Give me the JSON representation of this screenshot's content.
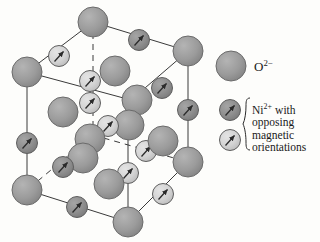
{
  "figure": {
    "background_color": "#fdfdfb",
    "line_color": "#3a3a3a"
  },
  "legend": {
    "oxygen": {
      "icon": "large-gray-sphere",
      "label_main": "O",
      "label_sup": "2−",
      "color": "#9b9b9b",
      "stroke": "#6b6b6b"
    },
    "nickel": {
      "icon_dark": "dark-gray-sphere-with-arrow",
      "icon_light": "light-gray-sphere-with-arrow",
      "color_dark": "#8e8e8e",
      "color_light": "#d3d3d3",
      "stroke": "#5f5f5f",
      "arrow_color": "#2b2b2b",
      "brace": "curly-brace",
      "label_line1_main": "Ni",
      "label_line1_sup": "2+",
      "label_line1_rest": " with",
      "label_line2": "opposing",
      "label_line3": "magnetic",
      "label_line4": "orientations"
    }
  },
  "structure": {
    "type": "rock-salt unit cell, perspective view",
    "oxygen_label": "O2-",
    "nickel_dark_label": "Ni2+ spin up-right (sublattice A)",
    "nickel_light_label": "Ni2+ spin up-right (sublattice B)",
    "cube_edges_solid": 9,
    "cube_edges_dashed": 3,
    "oxygen_radius_px": 15,
    "nickel_radius_px": 10.5,
    "oxygen_atoms": [
      {
        "id": "O-top-back",
        "x": 93,
        "y": 22
      },
      {
        "id": "O-left-back",
        "x": 27,
        "y": 72
      },
      {
        "id": "O-right-back",
        "x": 188,
        "y": 51
      },
      {
        "id": "O-center-upper",
        "x": 115,
        "y": 71
      },
      {
        "id": "O-mid-left",
        "x": 63,
        "y": 110
      },
      {
        "id": "O-center-mid",
        "x": 137,
        "y": 99
      },
      {
        "id": "O-center-core",
        "x": 131,
        "y": 126
      },
      {
        "id": "O-inner-left",
        "x": 90,
        "y": 133
      },
      {
        "id": "O-inner-left2",
        "x": 80,
        "y": 157
      },
      {
        "id": "O-center-low",
        "x": 154,
        "y": 145
      },
      {
        "id": "O-right-mid",
        "x": 188,
        "y": 162
      },
      {
        "id": "O-left-front",
        "x": 27,
        "y": 190
      },
      {
        "id": "O-center-front",
        "x": 108,
        "y": 181
      },
      {
        "id": "O-bottom-front",
        "x": 128,
        "y": 222
      }
    ],
    "nickel_atoms": [
      {
        "id": "Ni-a1",
        "x": 139,
        "y": 40,
        "shade": "dark"
      },
      {
        "id": "Ni-a2",
        "x": 59,
        "y": 56,
        "shade": "light"
      },
      {
        "id": "Ni-a3",
        "x": 88,
        "y": 84,
        "shade": "light"
      },
      {
        "id": "Ni-a4",
        "x": 88,
        "y": 105,
        "shade": "light"
      },
      {
        "id": "Ni-a5",
        "x": 161,
        "y": 89,
        "shade": "dark"
      },
      {
        "id": "Ni-a6",
        "x": 189,
        "y": 111,
        "shade": "dark"
      },
      {
        "id": "Ni-a7",
        "x": 108,
        "y": 128,
        "shade": "light"
      },
      {
        "id": "Ni-a8",
        "x": 29,
        "y": 143,
        "shade": "dark"
      },
      {
        "id": "Ni-a9",
        "x": 145,
        "y": 156,
        "shade": "light"
      },
      {
        "id": "Ni-a10",
        "x": 62,
        "y": 170,
        "shade": "dark"
      },
      {
        "id": "Ni-a11",
        "x": 130,
        "y": 178,
        "shade": "light"
      },
      {
        "id": "Ni-a12",
        "x": 167,
        "y": 197,
        "shade": "light"
      },
      {
        "id": "Ni-a13",
        "x": 77,
        "y": 209,
        "shade": "dark"
      }
    ]
  }
}
